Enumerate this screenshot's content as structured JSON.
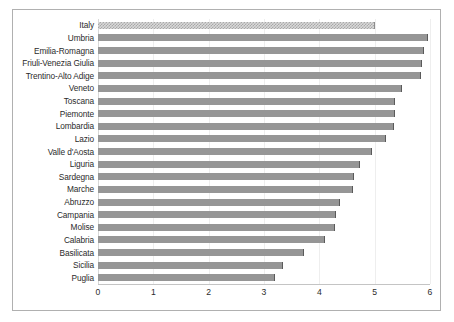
{
  "chart_data": {
    "type": "bar",
    "orientation": "horizontal",
    "title": "",
    "subtitle": "",
    "xlabel": "",
    "ylabel": "",
    "xlim": [
      0,
      6
    ],
    "xticks": [
      0,
      1,
      2,
      3,
      4,
      5,
      6
    ],
    "xtick_labels": [
      "0",
      "1",
      "2",
      "3",
      "4",
      "5",
      "6"
    ],
    "grid": true,
    "grid_axis": "x",
    "legend": false,
    "legend_position": "none",
    "bar_color": "#969696",
    "highlight_color": "#d9d9d9",
    "highlight_category": "Italy",
    "categories": [
      "Italy",
      "Umbria",
      "Emilia-Romagna",
      "Friuli-Venezia Giulia",
      "Trentino-Alto Adige",
      "Veneto",
      "Toscana",
      "Piemonte",
      "Lombardia",
      "Lazio",
      "Valle d'Aosta",
      "Liguria",
      "Sardegna",
      "Marche",
      "Abruzzo",
      "Campania",
      "Molise",
      "Calabria",
      "Basilicata",
      "Sicilia",
      "Puglia"
    ],
    "values": [
      5.0,
      5.96,
      5.89,
      5.86,
      5.84,
      5.5,
      5.37,
      5.37,
      5.35,
      5.2,
      4.95,
      4.74,
      4.63,
      4.6,
      4.38,
      4.3,
      4.28,
      4.1,
      3.72,
      3.35,
      3.19
    ]
  }
}
